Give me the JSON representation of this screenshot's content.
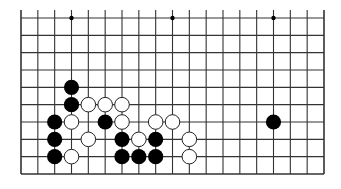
{
  "diagram": {
    "type": "go-board-fragment",
    "columns": 19,
    "rows": 10,
    "open_edge": "top",
    "star_points": [
      [
        3,
        0
      ],
      [
        9,
        0
      ],
      [
        15,
        0
      ]
    ],
    "stones": {
      "black": [
        [
          3,
          4
        ],
        [
          3,
          5
        ],
        [
          2,
          6
        ],
        [
          5,
          6
        ],
        [
          2,
          7
        ],
        [
          6,
          7
        ],
        [
          8,
          7
        ],
        [
          2,
          8
        ],
        [
          6,
          8
        ],
        [
          7,
          8
        ],
        [
          8,
          8
        ],
        [
          15,
          6
        ]
      ],
      "white": [
        [
          4,
          5
        ],
        [
          5,
          5
        ],
        [
          6,
          5
        ],
        [
          3,
          6
        ],
        [
          6,
          6
        ],
        [
          8,
          6
        ],
        [
          9,
          6
        ],
        [
          4,
          7
        ],
        [
          7,
          7
        ],
        [
          10,
          7
        ],
        [
          3,
          8
        ],
        [
          10,
          8
        ]
      ]
    },
    "colors": {
      "line": "#333333",
      "black_stone": "#000000",
      "white_stone": "#ffffff",
      "stone_outline": "#222222",
      "background": "#ffffff"
    }
  }
}
